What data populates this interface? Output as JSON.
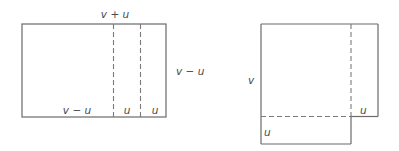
{
  "figure_left": {
    "labels": {
      "top": "v + u",
      "right": "v − u",
      "bottom_left": "v − u",
      "bottom_mid": "u",
      "bottom_right": "u"
    }
  },
  "figure_right": {
    "labels": {
      "left": "v",
      "right_ext": "u",
      "bottom_ext": "u"
    }
  },
  "colors": {
    "line": "#6a6a6a",
    "text": "#4a4a4a",
    "background": "#ffffff"
  }
}
